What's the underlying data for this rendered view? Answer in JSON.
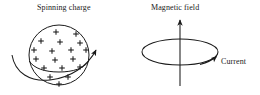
{
  "figure": {
    "width": 260,
    "height": 95,
    "background_color": "#ffffff",
    "stroke_color": "#1a1a1a",
    "text_color": "#1a1a1a"
  },
  "labels": {
    "spinning_charge": "Spinning charge",
    "magnetic_field": "Magnetic field",
    "current": "Current"
  },
  "icons": {
    "sphere": "charged-sphere-icon",
    "plus": "plus-charge-icon",
    "spin_arrow": "spin-rotation-arrow-icon",
    "loop": "current-loop-icon",
    "field_arrow": "magnetic-field-arrow-icon",
    "current_arrow": "current-direction-arrow-icon"
  },
  "diagram_left": {
    "name": "spinning-charge-diagram",
    "sphere": {
      "cx": 59,
      "cy": 55,
      "r": 30
    },
    "equator": {
      "cx": 59,
      "cy": 64,
      "rx": 30,
      "ry": 6
    },
    "plus_count": 18,
    "plus_positions": [
      [
        56,
        32
      ],
      [
        76,
        34
      ],
      [
        41,
        41
      ],
      [
        60,
        42
      ],
      [
        80,
        43
      ],
      [
        34,
        50
      ],
      [
        52,
        51
      ],
      [
        71,
        50
      ],
      [
        86,
        50
      ],
      [
        36,
        59
      ],
      [
        55,
        60
      ],
      [
        73,
        59
      ],
      [
        44,
        68
      ],
      [
        62,
        68
      ],
      [
        80,
        67
      ],
      [
        50,
        77
      ],
      [
        68,
        77
      ],
      [
        59,
        84
      ]
    ],
    "spin_arrow": {
      "path": "M 12,55 C 16,76 44,84 70,74 C 84,68 93,58 97,49",
      "arrow_tip": [
        98,
        46
      ],
      "direction": "counterclockwise-to-upper-right"
    }
  },
  "diagram_right": {
    "name": "magnetic-field-diagram",
    "loop": {
      "cx": 180,
      "cy": 52,
      "rx": 38,
      "ry": 13
    },
    "field_arrow": {
      "x": 180,
      "y_start": 86,
      "y_end": 18,
      "direction": "up"
    },
    "current_arrow": {
      "arrow_tip": [
        217,
        57
      ],
      "direction": "up-right-tangent-to-loop"
    }
  }
}
